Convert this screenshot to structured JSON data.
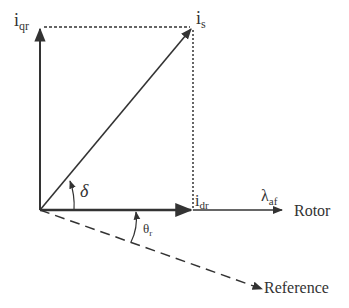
{
  "diagram": {
    "vectors": {
      "i_qr": {
        "main": "i",
        "sub": "qr"
      },
      "i_s": {
        "main": "i",
        "sub": "s"
      },
      "i_dr": {
        "main": "i",
        "sub": "dr"
      },
      "lambda_af": {
        "main": "λ",
        "sub": "af"
      }
    },
    "angles": {
      "delta": "δ",
      "theta_r": {
        "main": "θ",
        "sub": "r"
      }
    },
    "axes": {
      "rotor": "Rotor",
      "reference": "Reference"
    },
    "colors": {
      "line": "#333333",
      "background": "#ffffff"
    }
  }
}
